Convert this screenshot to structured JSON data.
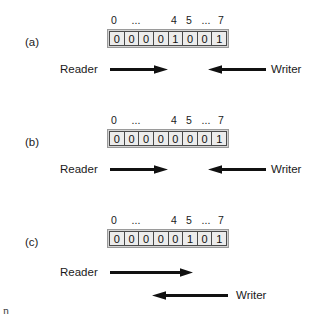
{
  "figure": {
    "panels": [
      {
        "label": "(a)",
        "index_labels": [
          "0",
          "...",
          "4",
          "5",
          "...",
          "7"
        ],
        "bits": [
          "0",
          "0",
          "0",
          "0",
          "1",
          "0",
          "0",
          "1"
        ],
        "reader_label": "Reader",
        "writer_label": "Writer",
        "layout": "same-line"
      },
      {
        "label": "(b)",
        "index_labels": [
          "0",
          "...",
          "4",
          "5",
          "...",
          "7"
        ],
        "bits": [
          "0",
          "0",
          "0",
          "0",
          "0",
          "0",
          "0",
          "1"
        ],
        "reader_label": "Reader",
        "writer_label": "Writer",
        "layout": "same-line"
      },
      {
        "label": "(c)",
        "index_labels": [
          "0",
          "...",
          "4",
          "5",
          "...",
          "7"
        ],
        "bits": [
          "0",
          "0",
          "0",
          "0",
          "0",
          "1",
          "0",
          "1"
        ],
        "reader_label": "Reader",
        "writer_label": "Writer",
        "layout": "stacked-overlap"
      }
    ],
    "colors": {
      "cell_fill": "#ececec",
      "cell_border": "#4a4a4a",
      "frame_fill": "#d4d4d4",
      "arrow": "#111111",
      "text": "#1a1a1a"
    },
    "artifact_text": "n"
  }
}
